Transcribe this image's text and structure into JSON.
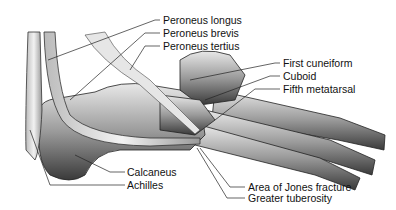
{
  "diagram": {
    "labels": {
      "peroneus_longus": "Peroneus longus",
      "peroneus_brevis": "Peroneus brevis",
      "peroneus_tertius": "Peroneus tertius",
      "first_cuneiform": "First cuneiform",
      "cuboid": "Cuboid",
      "fifth_metatarsal": "Fifth metatarsal",
      "calcaneus": "Calcaneus",
      "achilles": "Achilles",
      "jones_fracture": "Area of Jones fracture",
      "greater_tuberosity": "Greater tuberosity"
    }
  }
}
